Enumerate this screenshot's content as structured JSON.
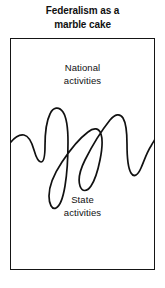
{
  "figure": {
    "title": {
      "line1": "Federalism as a",
      "line2": "marble cake"
    },
    "upper_region": {
      "line1": "National",
      "line2": "activities"
    },
    "lower_region": {
      "line1": "State",
      "line2": "activities"
    },
    "colors": {
      "ink": "#111111",
      "background": "#ffffff",
      "border": "#151515"
    },
    "marble_line": {
      "description": "wavy marble swirl dividing national and state activities",
      "path": "M 0 105 C 4 100, 9 96, 14 97 C 19 98, 22 105, 24 112 C 26 119, 28 124, 31 124 C 34 124, 35 117, 35 108 C 35 96, 36 84, 40 76 C 43 69, 49 68, 53 74 C 57 80, 58 92, 58 104 C 58 120, 57 136, 55 148 C 53 160, 50 168, 46 170 C 42 172, 39 166, 39 158 C 39 148, 44 136, 52 124 C 60 112, 70 100, 78 94 C 84 89, 89 90, 91 96 C 93 102, 92 112, 90 122 C 88 132, 85 142, 81 148 C 77 154, 72 154, 70 148 C 68 142, 70 132, 75 122 C 82 108, 92 92, 100 82 C 105 76, 110 75, 113 80 C 116 85, 117 95, 117 106 C 117 118, 118 130, 121 135 C 124 140, 128 137, 131 130 C 134 123, 137 114, 141 108 C 143 104, 145 102, 145 101"
    }
  }
}
